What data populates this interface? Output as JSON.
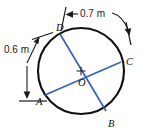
{
  "figure": {
    "type": "geometry-diagram",
    "shape": "circle-with-two-chords",
    "colors": {
      "circle_stroke": "#111111",
      "chord_stroke": "#3a62b5",
      "dimension_stroke": "#1a1a1a",
      "background": "#ffffff",
      "text": "#111111"
    },
    "circle": {
      "center_label": "O",
      "center_x": 81,
      "center_y": 71,
      "radius": 43
    },
    "points": [
      {
        "id": "A",
        "label": "A",
        "x": 45,
        "y": 95
      },
      {
        "id": "B",
        "label": "B",
        "x": 106,
        "y": 111
      },
      {
        "id": "C",
        "label": "C",
        "x": 121,
        "y": 62
      },
      {
        "id": "D",
        "label": "D",
        "x": 60,
        "y": 34
      },
      {
        "id": "O",
        "label": "O",
        "x": 81,
        "y": 71
      }
    ],
    "chords": [
      {
        "id": "chord-AC",
        "from": "A",
        "to": "C"
      },
      {
        "id": "chord-DB",
        "from": "D",
        "to": "B"
      }
    ],
    "dimensions": [
      {
        "id": "dim-left",
        "label": "0.6 m",
        "orientation": "vertical",
        "measures": "arc-chord D to A",
        "arrowheads": "both"
      },
      {
        "id": "dim-top",
        "label": "0.7 m",
        "orientation": "horizontal",
        "measures": "arc D to C",
        "arrowheads": "both"
      }
    ]
  }
}
